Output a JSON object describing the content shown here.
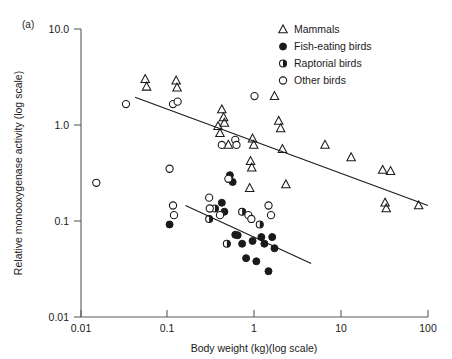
{
  "panel": {
    "label": "(a)"
  },
  "axes": {
    "x": {
      "title": "Body weight (kg)(log scale)",
      "ticks": [
        "0.01",
        "0.1",
        "1",
        "10",
        "100"
      ],
      "min": 0.01,
      "max": 100,
      "scale": "log"
    },
    "y": {
      "title": "Relative monooxygenase activity (log scale)",
      "ticks": [
        "10.0",
        "1.0",
        "0.1",
        "0.01"
      ],
      "min": 0.01,
      "max": 10.0,
      "scale": "log"
    }
  },
  "legend": {
    "position": "top-right",
    "items": [
      {
        "label": "Mammals",
        "marker": "open-triangle"
      },
      {
        "label": "Fish-eating birds",
        "marker": "filled-circle"
      },
      {
        "label": "Raptorial birds",
        "marker": "half-filled-circle"
      },
      {
        "label": "Other birds",
        "marker": "open-circle"
      }
    ]
  },
  "chart_data": {
    "type": "scatter",
    "title": "",
    "xlabel": "Body weight (kg)(log scale)",
    "ylabel": "Relative monooxygenase activity (log scale)",
    "xscale": "log",
    "yscale": "log",
    "xlim": [
      0.01,
      100
    ],
    "ylim": [
      0.01,
      10.0
    ],
    "grid": false,
    "series": [
      {
        "name": "Mammals",
        "marker": "open-triangle",
        "points": [
          [
            0.055,
            3.0
          ],
          [
            0.057,
            2.5
          ],
          [
            0.125,
            2.9
          ],
          [
            0.128,
            2.45
          ],
          [
            0.42,
            1.45
          ],
          [
            0.44,
            1.2
          ],
          [
            0.45,
            1.05
          ],
          [
            0.4,
            0.82
          ],
          [
            0.38,
            0.97
          ],
          [
            0.5,
            0.62
          ],
          [
            0.95,
            0.72
          ],
          [
            0.98,
            0.62
          ],
          [
            0.9,
            0.42
          ],
          [
            0.93,
            0.36
          ],
          [
            0.88,
            0.22
          ],
          [
            1.7,
            2.0
          ],
          [
            1.9,
            1.1
          ],
          [
            2.0,
            0.92
          ],
          [
            2.1,
            0.56
          ],
          [
            2.3,
            0.24
          ],
          [
            6.5,
            0.62
          ],
          [
            13.0,
            0.46
          ],
          [
            30.0,
            0.34
          ],
          [
            37.0,
            0.33
          ],
          [
            32.0,
            0.155
          ],
          [
            33.0,
            0.135
          ],
          [
            78.0,
            0.145
          ]
        ]
      },
      {
        "name": "Fish-eating birds",
        "marker": "filled-circle",
        "points": [
          [
            0.105,
            0.092
          ],
          [
            0.52,
            0.3
          ],
          [
            0.56,
            0.255
          ],
          [
            0.45,
            0.125
          ],
          [
            0.6,
            0.072
          ],
          [
            0.64,
            0.071
          ],
          [
            0.72,
            0.058
          ],
          [
            0.8,
            0.041
          ],
          [
            0.95,
            0.062
          ],
          [
            1.05,
            0.038
          ],
          [
            1.2,
            0.068
          ],
          [
            1.3,
            0.058
          ],
          [
            1.45,
            0.03
          ],
          [
            1.6,
            0.068
          ],
          [
            1.7,
            0.052
          ],
          [
            0.42,
            0.155
          ]
        ]
      },
      {
        "name": "Raptorial birds",
        "marker": "half-filled-circle",
        "points": [
          [
            0.3,
            0.105
          ],
          [
            0.48,
            0.058
          ],
          [
            0.72,
            0.125
          ],
          [
            1.15,
            0.092
          ],
          [
            0.35,
            0.135
          ]
        ]
      },
      {
        "name": "Other birds",
        "marker": "open-circle",
        "points": [
          [
            0.015,
            0.25
          ],
          [
            0.033,
            1.65
          ],
          [
            0.115,
            1.65
          ],
          [
            0.13,
            1.75
          ],
          [
            0.105,
            0.35
          ],
          [
            0.115,
            0.145
          ],
          [
            0.118,
            0.115
          ],
          [
            0.3,
            0.175
          ],
          [
            0.305,
            0.135
          ],
          [
            0.42,
            0.62
          ],
          [
            0.5,
            0.275
          ],
          [
            0.6,
            0.7
          ],
          [
            0.62,
            0.62
          ],
          [
            0.85,
            0.115
          ],
          [
            0.92,
            0.105
          ],
          [
            0.4,
            0.115
          ],
          [
            1.45,
            0.145
          ],
          [
            1.55,
            0.115
          ],
          [
            1.0,
            2.0
          ]
        ]
      }
    ],
    "trendlines": [
      {
        "name": "mammals-regression",
        "x": [
          0.042,
          100.0
        ],
        "y": [
          1.95,
          0.145
        ]
      },
      {
        "name": "birds-regression",
        "x": [
          0.16,
          4.5
        ],
        "y": [
          0.145,
          0.036
        ]
      }
    ]
  }
}
